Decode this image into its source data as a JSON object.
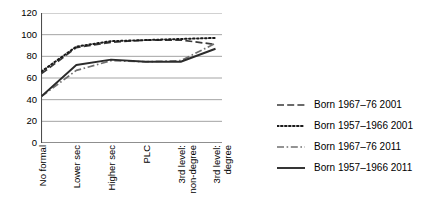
{
  "chart_data": {
    "type": "line",
    "title": "",
    "xlabel": "",
    "ylabel": "",
    "ylim": [
      0,
      120
    ],
    "ytick_step": 20,
    "yticks": [
      120,
      100,
      80,
      60,
      40,
      20,
      0
    ],
    "grid": true,
    "grid_axis": "y",
    "legend_position": "right",
    "categories": [
      "No formal",
      "Lower sec",
      "Higher sec",
      "PLC",
      "3rd level:\nnon-degree",
      "3rd level:\ndegree"
    ],
    "series": [
      {
        "name": "Born 1967–76 2001",
        "style": "dashed",
        "color": "#3a3a3a",
        "values": [
          64,
          88,
          93,
          95,
          95,
          91
        ]
      },
      {
        "name": "Born 1957–1966 2001",
        "style": "dotted",
        "color": "#1a1a1a",
        "values": [
          66,
          89,
          94,
          95,
          96,
          97
        ]
      },
      {
        "name": "Born 1967–76 2011",
        "style": "dashdot",
        "color": "#707070",
        "values": [
          43,
          67,
          76,
          75,
          76,
          92
        ]
      },
      {
        "name": "Born 1957–1966 2011",
        "style": "solid",
        "color": "#2b2b2b",
        "values": [
          43,
          72,
          77,
          75,
          75,
          87
        ]
      }
    ]
  },
  "legend": {
    "items": [
      {
        "label": "Born 1967–76 2001",
        "style": "dashed"
      },
      {
        "label": "Born 1957–1966 2001",
        "style": "dotted"
      },
      {
        "label": "Born 1967–76 2011",
        "style": "dashdot"
      },
      {
        "label": "Born 1957–1966 2011",
        "style": "solid"
      }
    ]
  },
  "axis": {
    "y_tick_labels": [
      "120",
      "100",
      "80",
      "60",
      "40",
      "20",
      "0"
    ],
    "x_tick_labels": [
      "No formal",
      "Lower sec",
      "Higher sec",
      "PLC",
      "3rd level:\nnon-degree",
      "3rd level:\ndegree"
    ]
  }
}
